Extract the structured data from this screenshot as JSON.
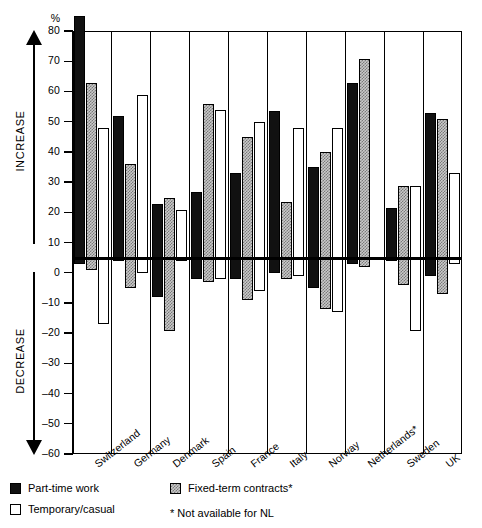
{
  "chart_data": {
    "type": "bar",
    "title": "",
    "xlabel": "",
    "ylabel": "%",
    "ylim": [
      -60,
      80
    ],
    "ytick_values": [
      80,
      70,
      60,
      50,
      40,
      30,
      20,
      10,
      0,
      -10,
      -20,
      -30,
      -40,
      -50,
      -60
    ],
    "ytick_labels": [
      "80",
      "70",
      "60",
      "50",
      "40",
      "30",
      "20",
      "10",
      "0",
      "–10",
      "–20",
      "–30",
      "–40",
      "–50",
      "–60"
    ],
    "grid": "vertical-group-separators",
    "axis_annotations": {
      "increase": "INCREASE",
      "decrease": "DECREASE",
      "unit": "%"
    },
    "categories": [
      "Switzerland",
      "Germany",
      "Denmark",
      "Spain",
      "France",
      "Italy",
      "Norway",
      "Netherlands*",
      "Sweden",
      "UK"
    ],
    "legend_position": "below-plot",
    "series": [
      {
        "name": "Part-time work",
        "color": "#111111",
        "swatch": "black-filled",
        "increase": [
          80,
          47,
          18,
          22,
          28,
          48.5,
          30,
          58,
          16.5,
          48
        ],
        "decrease": [
          -2,
          -1,
          -13,
          -7,
          -7,
          -5,
          -10,
          -2,
          -1,
          -6
        ]
      },
      {
        "name": "Fixed-term contracts*",
        "color": "#c9c9c9",
        "swatch": "grey-stippled",
        "increase": [
          58,
          31,
          20,
          51,
          40,
          18.5,
          35,
          66,
          24,
          46
        ],
        "decrease": [
          -4,
          -10,
          -24,
          -8,
          -14,
          -7,
          -17,
          -3,
          -9,
          -12
        ]
      },
      {
        "name": "Temporary/casual",
        "color": "#ffffff",
        "swatch": "white-outline",
        "increase": [
          43,
          54,
          16,
          49,
          45,
          43,
          43,
          null,
          24,
          28
        ],
        "decrease": [
          -22,
          -5,
          -1,
          -7,
          -11,
          -6,
          -18,
          null,
          -24,
          -2
        ]
      }
    ],
    "footnote": "* Not available for NL"
  },
  "legend": {
    "items": [
      {
        "label": "Part-time work",
        "swatch": "black-filled"
      },
      {
        "label": "Fixed-term contracts*",
        "swatch": "grey-stippled"
      },
      {
        "label": "Temporary/casual",
        "swatch": "white-outline"
      }
    ],
    "note": "* Not available for NL"
  }
}
